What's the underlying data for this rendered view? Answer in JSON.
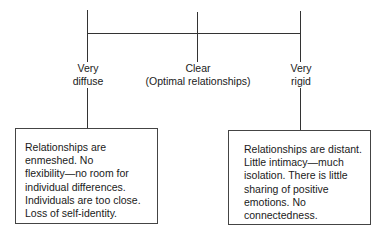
{
  "diagram": {
    "nodes": {
      "very_diffuse": {
        "line1": "Very",
        "line2": "diffuse"
      },
      "clear": {
        "line1": "Clear",
        "line2": "(Optimal relationships)"
      },
      "very_rigid": {
        "line1": "Very",
        "line2": "rigid"
      }
    },
    "boxes": {
      "left": {
        "lines": [
          "Relationships are",
          "enmeshed. No",
          "flexibility—no room for",
          "individual differences.",
          "Individuals are too close.",
          "Loss of self-identity."
        ]
      },
      "right": {
        "lines": [
          "Relationships are distant.",
          "Little intimacy—much",
          "isolation. There is little",
          "sharing of positive",
          "emotions. No",
          "connectedness."
        ]
      }
    },
    "colors": {
      "line": "#333333",
      "text": "#1a1a1a",
      "background": "#ffffff"
    }
  }
}
